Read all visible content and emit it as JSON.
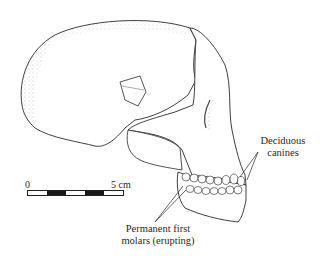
{
  "figure": {
    "colors": {
      "line": "#2a2a2a",
      "stipple": "#555555",
      "background": "#ffffff"
    }
  },
  "labels": {
    "deciduous_canines": {
      "line1": "Deciduous",
      "line2": "canines"
    },
    "permanent_first_molars": {
      "line1": "Permanent first",
      "line2": "molars (erupting)"
    }
  },
  "scale_bar": {
    "start_label": "0",
    "end_label": "5 cm",
    "segments": [
      "white",
      "black",
      "white",
      "black",
      "white"
    ]
  }
}
